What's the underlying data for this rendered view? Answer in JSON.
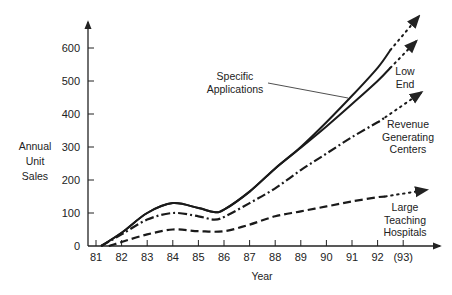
{
  "chart_data": {
    "type": "line",
    "title": "",
    "xlabel": "Year",
    "ylabel": [
      "Annual",
      "Unit",
      "Sales"
    ],
    "xlim": [
      81,
      94
    ],
    "ylim": [
      0,
      600
    ],
    "x_ticks": [
      81,
      82,
      83,
      84,
      85,
      86,
      87,
      88,
      89,
      90,
      91,
      92,
      93
    ],
    "x_tick_labels": [
      "81",
      "82",
      "83",
      "84",
      "85",
      "86",
      "87",
      "88",
      "89",
      "90",
      "91",
      "92",
      "(93)"
    ],
    "y_ticks": [
      0,
      100,
      200,
      300,
      400,
      500,
      600
    ],
    "y_tick_labels": [
      "0",
      "100",
      "200",
      "300",
      "400",
      "500",
      "600"
    ],
    "grid": false,
    "legend": "none (inline labels)",
    "series": [
      {
        "name": "Specific Applications",
        "style": "solid",
        "labels": [
          "Specific",
          "Applications"
        ],
        "x": [
          81.2,
          82,
          83,
          84,
          85,
          85.6,
          86,
          87,
          88,
          89,
          90,
          91,
          92,
          92.5
        ],
        "y": [
          0,
          40,
          100,
          130,
          115,
          103,
          110,
          165,
          235,
          300,
          375,
          455,
          540,
          594
        ],
        "projection": {
          "x": [
            92.5,
            93.6
          ],
          "y": [
            594,
            695
          ]
        }
      },
      {
        "name": "Low End",
        "style": "solid",
        "labels": [
          "Low",
          "End"
        ],
        "x": [
          81.2,
          82,
          83,
          84,
          85,
          85.6,
          86,
          87,
          88,
          89,
          90,
          91,
          92,
          92.5
        ],
        "y": [
          0,
          40,
          100,
          130,
          115,
          103,
          110,
          165,
          235,
          298,
          362,
          430,
          500,
          540
        ],
        "projection": {
          "x": [
            92.5,
            93.5
          ],
          "y": [
            540,
            620
          ]
        }
      },
      {
        "name": "Revenue Generating Centers",
        "style": "dash-dot",
        "labels": [
          "Revenue",
          "Generating",
          "Centers"
        ],
        "x": [
          81.2,
          82,
          83,
          84,
          85,
          85.6,
          86,
          87,
          88,
          89,
          90,
          91,
          92,
          92.3
        ],
        "y": [
          0,
          35,
          80,
          100,
          90,
          80,
          88,
          130,
          175,
          230,
          280,
          330,
          375,
          390
        ],
        "projection": {
          "x": [
            92.3,
            93.7
          ],
          "y": [
            390,
            465
          ]
        }
      },
      {
        "name": "Large Teaching Hospitals",
        "style": "dashed",
        "labels": [
          "Large",
          "Teaching",
          "Hospitals"
        ],
        "x": [
          81.5,
          82,
          83,
          84,
          85,
          86,
          87,
          88,
          89,
          90,
          91,
          92,
          92.3
        ],
        "y": [
          0,
          12,
          35,
          50,
          45,
          45,
          65,
          90,
          105,
          120,
          135,
          148,
          150
        ],
        "projection": {
          "x": [
            92.3,
            93.9
          ],
          "y": [
            150,
            170
          ]
        }
      }
    ]
  }
}
